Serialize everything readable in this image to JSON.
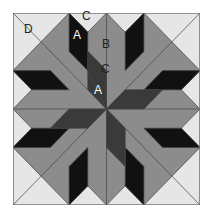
{
  "diagram": {
    "type": "quilt-block",
    "colors": {
      "light": "#e6e6e6",
      "medium": "#8c8c8c",
      "dark": "#3a3a3a",
      "black": "#111111",
      "stroke": "#444444",
      "frame": "#7a7a7a"
    },
    "labels": {
      "D": "D",
      "C_top": "C",
      "A_top": "A",
      "B": "B",
      "C_center": "C",
      "A_center": "A"
    }
  }
}
